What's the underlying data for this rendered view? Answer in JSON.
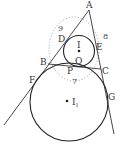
{
  "diagram": {
    "type": "geometry",
    "points": {
      "A": "A",
      "B": "B",
      "C": "C",
      "D": "D",
      "E": "E",
      "F": "F",
      "G": "G",
      "P": "P",
      "Q": "Q",
      "I": "I",
      "I1": "I",
      "I1_sub": "1"
    },
    "lengths": {
      "AB": "9",
      "AC": "8",
      "BC": "7"
    }
  }
}
